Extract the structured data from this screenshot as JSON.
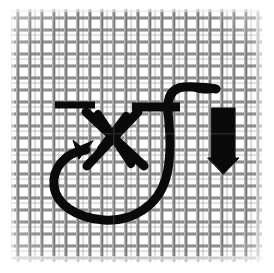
{
  "figure": {
    "width": 274,
    "height": 273,
    "background_color": "#ffffff",
    "caption": ""
  },
  "mesh": {
    "name": "woven wire screen mesh",
    "x": 10,
    "y": 8,
    "width": 254,
    "height": 256,
    "cell_pitch": 12,
    "wire_thickness": 3,
    "wire_color": "#8a8a8a",
    "wire_color_dark": "#5e5e5e",
    "wire_color_light": "#b9b9b9",
    "open_color": "#fdfdfd",
    "columns": 21,
    "rows": 21
  },
  "overlay": {
    "ink_color": "#0a0a0a",
    "stroke_width": 9,
    "elements": [
      {
        "name": "left-horizontal-stitch-bar",
        "type": "bar",
        "x1": 53,
        "y1": 105,
        "x2": 96,
        "y2": 105,
        "thickness": 7
      },
      {
        "name": "right-horizontal-stitch-bar",
        "type": "bar",
        "x1": 131,
        "y1": 107,
        "x2": 181,
        "y2": 107,
        "thickness": 9
      },
      {
        "name": "stitch-diagonal-down-right-outer",
        "type": "line",
        "x1": 85,
        "y1": 113,
        "x2": 143,
        "y2": 165,
        "thickness": 9
      },
      {
        "name": "stitch-diagonal-down-right-inner",
        "type": "line",
        "x1": 97,
        "y1": 113,
        "x2": 130,
        "y2": 163,
        "thickness": 8
      },
      {
        "name": "stitch-diagonal-down-left-outer",
        "type": "line",
        "x1": 137,
        "y1": 113,
        "x2": 86,
        "y2": 165,
        "thickness": 9
      },
      {
        "name": "stitch-diagonal-down-left-inner",
        "type": "line",
        "x1": 125,
        "y1": 115,
        "x2": 100,
        "y2": 148,
        "thickness": 8
      },
      {
        "name": "thread-loop-curve",
        "type": "path",
        "thickness": 9
      },
      {
        "name": "thread-direction-arrowhead",
        "type": "arrowhead",
        "tip_x": 90,
        "tip_y": 145,
        "direction": "up-right"
      },
      {
        "name": "thread-tail-hook",
        "type": "path",
        "thickness": 9,
        "tip_x": 219,
        "tip_y": 89
      },
      {
        "name": "down-arrow-indicator",
        "type": "block-arrow",
        "shaft_x": 212,
        "shaft_y": 108,
        "shaft_width": 23,
        "shaft_height": 52,
        "head_width": 31,
        "head_tip_y": 173,
        "direction": "down"
      }
    ]
  }
}
